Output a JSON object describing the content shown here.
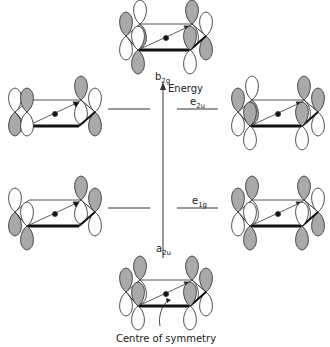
{
  "diagram": {
    "title": "",
    "axis": {
      "label": "Energy",
      "direction": "up"
    },
    "levels": [
      {
        "name": "a2u",
        "symbol": "a",
        "subscript": "2u",
        "degeneracy": 1,
        "order": 1
      },
      {
        "name": "e1g",
        "symbol": "e",
        "subscript": "1g",
        "degeneracy": 2,
        "order": 2
      },
      {
        "name": "e2u",
        "symbol": "e",
        "subscript": "2u",
        "degeneracy": 2,
        "order": 3
      },
      {
        "name": "b2g",
        "symbol": "b",
        "subscript": "2g",
        "degeneracy": 1,
        "order": 4
      }
    ],
    "orbital_pictures": [
      {
        "id": "b2g",
        "position": "top-center",
        "shaded": [
          "TL-up",
          "TR-up",
          "L-down",
          "R-down",
          "BL-down",
          "BR-up"
        ]
      },
      {
        "id": "e2u-left",
        "position": "middle-left"
      },
      {
        "id": "e2u-right",
        "position": "middle-right"
      },
      {
        "id": "e1g-left",
        "position": "lower-left"
      },
      {
        "id": "e1g-right",
        "position": "lower-right"
      },
      {
        "id": "a2u",
        "position": "bottom-center"
      }
    ],
    "annotation": "Centre of symmetry",
    "colors": {
      "lobe_shaded": "#a9a9a9",
      "lobe_open": "#ffffff",
      "line": "#222222"
    }
  },
  "labels": {
    "b2g_sym": "b",
    "b2g_sub": "2g",
    "e2u_sym": "e",
    "e2u_sub": "2u",
    "e1g_sym": "e",
    "e1g_sub": "1g",
    "a2u_sym": "a",
    "a2u_sub": "2u",
    "energy": "Energy",
    "centre": "Centre of symmetry"
  }
}
